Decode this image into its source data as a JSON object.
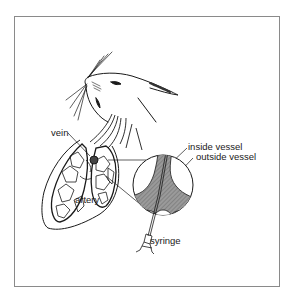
{
  "figure": {
    "labels": {
      "vein": "vein",
      "artery": "artery",
      "inside_vessel": "inside vessel",
      "outside_vessel": "outside vessel",
      "syringe": "syringe"
    },
    "colors": {
      "line": "#1a1a1a",
      "frame": "#8a8a8a",
      "vessel_fill": "#8c8c8c",
      "background": "#ffffff"
    }
  }
}
